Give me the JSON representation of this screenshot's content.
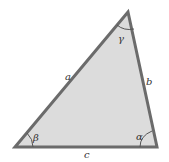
{
  "triangle": {
    "fill": "#dcdcdc",
    "stroke": "#6b6b6b",
    "vertices": {
      "top": [
        128,
        12
      ],
      "bottom_left": [
        15,
        147
      ],
      "bottom_right": [
        157,
        147
      ]
    }
  },
  "labels": {
    "side_a": "a",
    "side_b": "b",
    "side_c": "c",
    "angle_alpha": "α",
    "angle_beta": "β",
    "angle_gamma": "γ"
  }
}
